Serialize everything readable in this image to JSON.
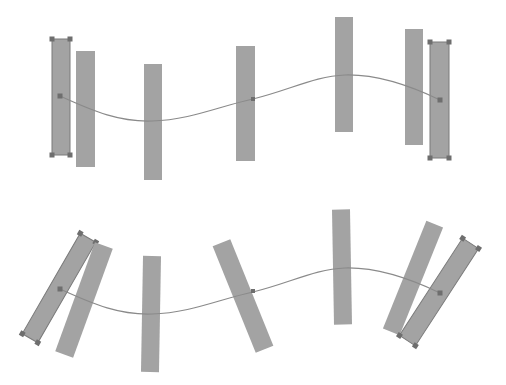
{
  "diagram": {
    "colors": {
      "rect_fill": "#a3a3a3",
      "path_stroke": "#8a8a8a",
      "handle": "#6e6e6e",
      "background": "#ffffff"
    },
    "top_panel": {
      "path": "M60,96 C95,112 120,122 152,121 C190,120 220,106 253,99 C290,90 315,76 345,75 C380,74 415,88 440,100",
      "endpoints": [
        [
          60,
          96
        ],
        [
          440,
          100
        ]
      ],
      "midpoint_handle": [
        253,
        99
      ],
      "rects": [
        {
          "cx": 61,
          "cy": 97,
          "w": 18,
          "h": 116,
          "angle": 0,
          "selected": true
        },
        {
          "cx": 85.5,
          "cy": 109,
          "w": 19,
          "h": 116,
          "angle": 0,
          "selected": false
        },
        {
          "cx": 153,
          "cy": 122,
          "w": 18,
          "h": 116,
          "angle": 0,
          "selected": false
        },
        {
          "cx": 245.5,
          "cy": 103.5,
          "w": 19,
          "h": 115,
          "angle": 0,
          "selected": false
        },
        {
          "cx": 344,
          "cy": 74.5,
          "w": 18,
          "h": 115,
          "angle": 0,
          "selected": false
        },
        {
          "cx": 414,
          "cy": 87,
          "w": 18,
          "h": 116,
          "angle": 0,
          "selected": false
        },
        {
          "cx": 439.5,
          "cy": 100,
          "w": 19,
          "h": 116,
          "angle": 0,
          "selected": true
        }
      ]
    },
    "bottom_panel": {
      "path": "M60,289 C95,305 120,315 152,314 C190,313 220,299 253,292 C290,283 315,269 345,268 C380,267 415,281 440,293",
      "endpoints": [
        [
          60,
          289
        ],
        [
          440,
          293
        ]
      ],
      "midpoint_handle": [
        253,
        291
      ],
      "rects": [
        {
          "cx": 59,
          "cy": 288,
          "w": 18,
          "h": 116,
          "angle": 30,
          "selected": true
        },
        {
          "cx": 84,
          "cy": 300,
          "w": 19,
          "h": 116,
          "angle": 20,
          "selected": false
        },
        {
          "cx": 151,
          "cy": 314,
          "w": 18,
          "h": 116,
          "angle": 1,
          "selected": false
        },
        {
          "cx": 243,
          "cy": 296,
          "w": 19,
          "h": 115,
          "angle": -22,
          "selected": false
        },
        {
          "cx": 342,
          "cy": 267,
          "w": 18,
          "h": 115,
          "angle": -1,
          "selected": false
        },
        {
          "cx": 413,
          "cy": 278,
          "w": 18,
          "h": 116,
          "angle": 22,
          "selected": false
        },
        {
          "cx": 439,
          "cy": 292,
          "w": 19,
          "h": 116,
          "angle": 33,
          "selected": true
        }
      ]
    }
  }
}
